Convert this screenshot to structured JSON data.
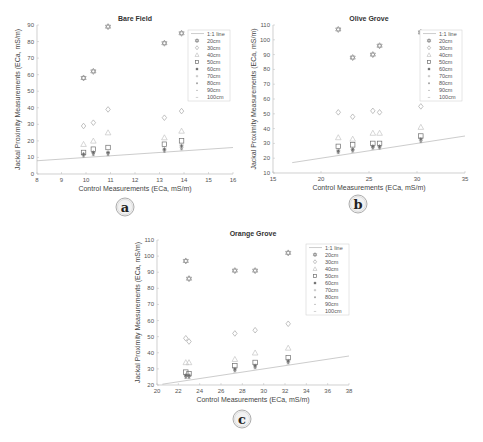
{
  "figure": {
    "panel_labels": [
      "a",
      "b",
      "c"
    ]
  },
  "chart_data": [
    {
      "type": "scatter",
      "panel": "a",
      "title": "Bare Field",
      "xlabel": "Control Measurements (ECa, mS/m)",
      "ylabel": "Jackal Proximity Measurements (ECa, mS/m)",
      "xlim": [
        8,
        16
      ],
      "ylim": [
        0,
        90
      ],
      "xticks": [
        8,
        9,
        10,
        11,
        12,
        13,
        14,
        15,
        16
      ],
      "yticks": [
        0,
        10,
        20,
        30,
        40,
        50,
        60,
        70,
        80,
        90
      ],
      "grid": false,
      "legend_position": "upper right",
      "legend": [
        "1:1 line",
        "20cm",
        "30cm",
        "40cm",
        "50cm",
        "60cm",
        "70cm",
        "80cm",
        "90cm",
        "100cm"
      ],
      "one_to_one_line": {
        "x": [
          8,
          16
        ],
        "y": [
          8,
          16
        ]
      },
      "x": [
        9.9,
        10.3,
        10.9,
        13.2,
        13.9
      ],
      "series": [
        {
          "name": "20cm",
          "marker": "hexagram",
          "values": [
            58,
            62,
            89,
            79,
            85
          ]
        },
        {
          "name": "30cm",
          "marker": "diamond",
          "values": [
            29,
            31,
            39,
            34,
            38
          ]
        },
        {
          "name": "40cm",
          "marker": "triangle",
          "values": [
            18,
            20,
            25,
            22,
            26
          ]
        },
        {
          "name": "50cm",
          "marker": "square",
          "values": [
            13,
            15,
            16,
            18,
            20
          ]
        },
        {
          "name": "60cm",
          "marker": "star",
          "values": [
            12,
            13,
            13,
            15,
            17
          ]
        },
        {
          "name": "70cm",
          "marker": "asterisk",
          "values": [
            11.5,
            12.5,
            12.5,
            14.5,
            16
          ]
        },
        {
          "name": "80cm",
          "marker": "plus",
          "values": [
            11,
            12,
            12,
            14,
            15.5
          ]
        },
        {
          "name": "90cm",
          "marker": "dot",
          "values": [
            10.5,
            11.5,
            11.5,
            13.5,
            15
          ]
        },
        {
          "name": "100cm",
          "marker": "dash",
          "values": [
            10,
            11,
            11,
            13,
            14.5
          ]
        }
      ]
    },
    {
      "type": "scatter",
      "panel": "b",
      "title": "Olive Grove",
      "xlabel": "Control Measurements (ECa, mS/m)",
      "ylabel": "Jackal Proximity Measurements (ECa, mS/m)",
      "xlim": [
        15,
        35
      ],
      "ylim": [
        10,
        110
      ],
      "xticks": [
        15,
        20,
        25,
        30,
        35
      ],
      "yticks": [
        10,
        20,
        30,
        40,
        50,
        60,
        70,
        80,
        90,
        100,
        110
      ],
      "grid": false,
      "legend_position": "upper right",
      "legend": [
        "1:1 line",
        "20cm",
        "30cm",
        "40cm",
        "50cm",
        "60cm",
        "70cm",
        "80cm",
        "90cm",
        "100cm"
      ],
      "one_to_one_line": {
        "x": [
          17,
          35
        ],
        "y": [
          17,
          35
        ]
      },
      "x": [
        21.8,
        23.3,
        25.4,
        26.1,
        30.4
      ],
      "series": [
        {
          "name": "20cm",
          "marker": "hexagram",
          "values": [
            107,
            88,
            90,
            96,
            105
          ]
        },
        {
          "name": "30cm",
          "marker": "diamond",
          "values": [
            51,
            48,
            52,
            51,
            55
          ]
        },
        {
          "name": "40cm",
          "marker": "triangle",
          "values": [
            34,
            33,
            37,
            37,
            41
          ]
        },
        {
          "name": "50cm",
          "marker": "square",
          "values": [
            28,
            29,
            30,
            30,
            35
          ]
        },
        {
          "name": "60cm",
          "marker": "star",
          "values": [
            25,
            26,
            28,
            28,
            33
          ]
        },
        {
          "name": "70cm",
          "marker": "asterisk",
          "values": [
            24.5,
            25.5,
            27.5,
            27.5,
            32
          ]
        },
        {
          "name": "80cm",
          "marker": "plus",
          "values": [
            24,
            25,
            27,
            27,
            31.5
          ]
        },
        {
          "name": "90cm",
          "marker": "dot",
          "values": [
            23.5,
            24.5,
            26.5,
            26.5,
            31
          ]
        },
        {
          "name": "100cm",
          "marker": "dash",
          "values": [
            23,
            24,
            26,
            26,
            30.5
          ]
        }
      ]
    },
    {
      "type": "scatter",
      "panel": "c",
      "title": "Orange Grove",
      "xlabel": "Control Measurements (ECa, mS/m)",
      "ylabel": "Jackal Proximity Measurements (ECa, mS/m)",
      "xlim": [
        20,
        38
      ],
      "ylim": [
        20,
        110
      ],
      "xticks": [
        20,
        22,
        24,
        26,
        28,
        30,
        32,
        34,
        36,
        38
      ],
      "yticks": [
        20,
        30,
        40,
        50,
        60,
        70,
        80,
        90,
        100,
        110
      ],
      "grid": false,
      "legend_position": "upper right",
      "legend": [
        "1:1 line",
        "20cm",
        "30cm",
        "40cm",
        "50cm",
        "60cm",
        "70cm",
        "80cm",
        "90cm",
        "100cm"
      ],
      "one_to_one_line": {
        "x": [
          20.5,
          38
        ],
        "y": [
          20.5,
          38
        ]
      },
      "x": [
        22.7,
        23.0,
        27.3,
        29.2,
        32.3
      ],
      "series": [
        {
          "name": "20cm",
          "marker": "hexagram",
          "values": [
            97,
            86,
            91,
            91,
            102
          ]
        },
        {
          "name": "30cm",
          "marker": "diamond",
          "values": [
            49,
            47,
            52,
            54,
            58
          ]
        },
        {
          "name": "40cm",
          "marker": "triangle",
          "values": [
            34,
            34,
            36,
            40,
            43
          ]
        },
        {
          "name": "50cm",
          "marker": "square",
          "values": [
            28,
            27,
            32,
            34,
            37
          ]
        },
        {
          "name": "60cm",
          "marker": "star",
          "values": [
            26,
            26,
            30,
            32,
            35
          ]
        },
        {
          "name": "70cm",
          "marker": "asterisk",
          "values": [
            25.5,
            25.5,
            29.5,
            31.5,
            34.5
          ]
        },
        {
          "name": "80cm",
          "marker": "plus",
          "values": [
            25,
            25,
            29,
            31,
            34
          ]
        },
        {
          "name": "90cm",
          "marker": "dot",
          "values": [
            24.5,
            24.5,
            28.5,
            30.5,
            33.5
          ]
        },
        {
          "name": "100cm",
          "marker": "dash",
          "values": [
            24,
            24,
            28,
            30,
            33
          ]
        }
      ]
    }
  ]
}
